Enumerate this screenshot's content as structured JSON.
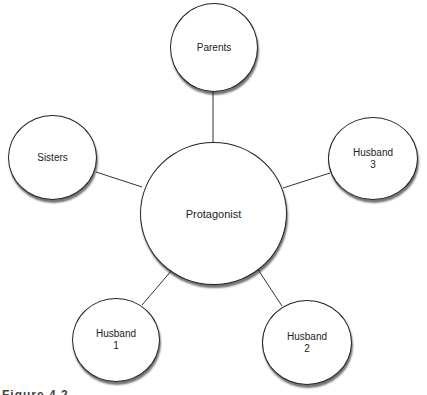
{
  "diagram": {
    "type": "hub-and-spoke",
    "center": {
      "label": "Protagonist"
    },
    "nodes": [
      {
        "id": "parents",
        "label": "Parents"
      },
      {
        "id": "sisters",
        "label": "Sisters"
      },
      {
        "id": "husband3",
        "label": "Husband\n3"
      },
      {
        "id": "husband1",
        "label": "Husband\n1"
      },
      {
        "id": "husband2",
        "label": "Husband\n2"
      }
    ],
    "edges": [
      [
        "Protagonist",
        "Parents"
      ],
      [
        "Protagonist",
        "Sisters"
      ],
      [
        "Protagonist",
        "Husband 3"
      ],
      [
        "Protagonist",
        "Husband 1"
      ],
      [
        "Protagonist",
        "Husband 2"
      ]
    ],
    "caption": "Figure 4.2 ..."
  }
}
